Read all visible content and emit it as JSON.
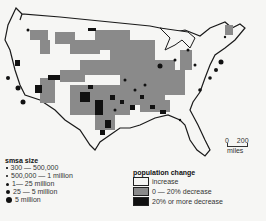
{
  "map": {
    "title": "SMSA population change, United States",
    "colors": {
      "increase": "#f6f6f4",
      "decrease_0_20": "#8a8a8a",
      "decrease_20_plus": "#111111",
      "outline": "#1a1a1a"
    }
  },
  "scale": {
    "start": "0",
    "end": "200",
    "unit": "miles"
  },
  "smsa_legend": {
    "title": "smsa size",
    "items": [
      {
        "label": "300 — 500,000",
        "size": 1.5
      },
      {
        "label": "500,000 — 1 million",
        "size": 2
      },
      {
        "label": "1— 25 million",
        "size": 3
      },
      {
        "label": "25 — 5 million",
        "size": 4
      },
      {
        "label": "5 million",
        "size": 6
      }
    ]
  },
  "population_legend": {
    "title": "population change",
    "items": [
      {
        "label": "increase",
        "color": "#f6f6f4"
      },
      {
        "label": "0 — 20% decrease",
        "color": "#8a8a8a"
      },
      {
        "label": "20% or more decrease",
        "color": "#111111"
      }
    ]
  }
}
